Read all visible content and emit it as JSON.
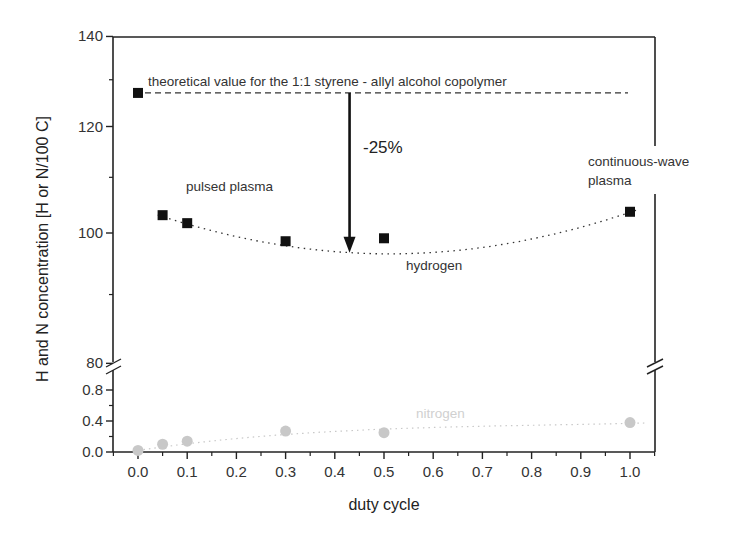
{
  "chart_data": {
    "type": "scatter",
    "title": "",
    "xlabel": "duty cycle",
    "ylabel": "H and N concentration [H or N/100 C]",
    "xlim": [
      -0.05,
      1.05
    ],
    "x_ticks": [
      "0.0",
      "0.1",
      "0.2",
      "0.3",
      "0.4",
      "0.5",
      "0.6",
      "0.7",
      "0.8",
      "0.9",
      "1.0"
    ],
    "y_axis_broken": true,
    "y_upper_segment": {
      "range": [
        80,
        140
      ],
      "scale": "log",
      "ticks": [
        "80",
        "100",
        "120",
        "140"
      ]
    },
    "y_lower_segment": {
      "range": [
        0.0,
        0.9
      ],
      "scale": "linear",
      "ticks": [
        "0.0",
        "0.4",
        "0.8"
      ]
    },
    "grid": false,
    "series": [
      {
        "name": "hydrogen",
        "marker": "square",
        "color": "#111111",
        "x": [
          0.0,
          0.05,
          0.1,
          0.3,
          0.5,
          1.0
        ],
        "y": [
          127.1,
          103.1,
          101.7,
          98.6,
          99.1,
          103.7
        ],
        "fit": "dotted polynomial through points 0.05–1.0"
      },
      {
        "name": "nitrogen",
        "marker": "circle",
        "color": "#c8c8c8",
        "x": [
          0.0,
          0.05,
          0.1,
          0.3,
          0.5,
          1.0
        ],
        "y": [
          0.02,
          0.1,
          0.14,
          0.27,
          0.25,
          0.38
        ],
        "fit": "dotted curve"
      }
    ],
    "reference_line": {
      "label": "theoretical value for the 1:1 styrene - allyl alcohol copolymer",
      "y": 127.1,
      "style": "dashed"
    },
    "annotations": [
      {
        "text": "-25%",
        "type": "arrow",
        "x": 0.43,
        "from_y": 127.1,
        "to_y": 97.0
      },
      {
        "text": "pulsed plasma"
      },
      {
        "text": "continuous-wave plasma"
      },
      {
        "text": "hydrogen"
      },
      {
        "text": "nitrogen"
      }
    ]
  },
  "labels": {
    "xlabel": "duty cycle",
    "ylabel": "H and N concentration [H or N/100 C]",
    "theory": "theoretical value for the 1:1 styrene - allyl alcohol copolymer",
    "reduction": "-25%",
    "pulsed_line1": "pulsed plasma",
    "cw_line1": "continuous-wave",
    "cw_line2": "plasma",
    "hydrogen": "hydrogen",
    "nitrogen": "nitrogen"
  },
  "colors": {
    "axis": "#222222",
    "hydrogen": "#111111",
    "nitrogen": "#c8c8c8",
    "nitrogen_label": "#cfcfcf"
  }
}
